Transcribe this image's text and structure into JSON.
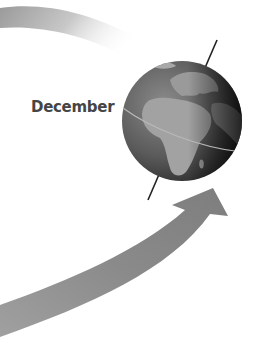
{
  "diagram": {
    "type": "earth-orbit-season",
    "month_label": "December",
    "colors": {
      "arrow": "#8a8a8a",
      "globe_ocean": "#6a6a6a",
      "globe_land": "#9a9a9a",
      "axis": "#222222",
      "text": "#454545"
    }
  }
}
